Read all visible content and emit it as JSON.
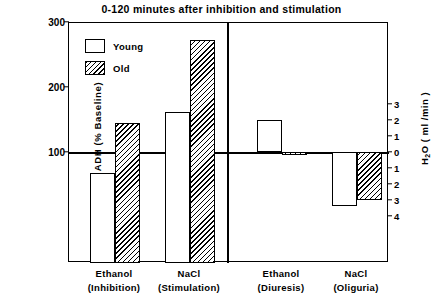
{
  "chart_data": {
    "type": "bar",
    "title": "0-120  minutes after inhibition and stimulation",
    "ylabel": "ADH (% Baseline)",
    "ylabel_right_pre": "H",
    "ylabel_right_sub": "2",
    "ylabel_right_post": "O  ( ml /min )",
    "ylabel_right_full": "H2O ( ml /min )",
    "xlabel": "",
    "grid": false,
    "legend_position": "top-left",
    "baseline_value": 100,
    "ylim": [
      0,
      300
    ],
    "ylim_right": [
      -4,
      3
    ],
    "left_axis_ticks": [
      {
        "label": "300",
        "value": 300
      },
      {
        "label": "200",
        "value": 200
      },
      {
        "label": "100",
        "value": 100
      }
    ],
    "right_axis_ticks": [
      {
        "label": "3",
        "value": 3
      },
      {
        "label": "2",
        "value": 2
      },
      {
        "label": "1",
        "value": 1
      },
      {
        "label": "0",
        "value": 0
      },
      {
        "label": "1",
        "value": -1
      },
      {
        "label": "2",
        "value": -2
      },
      {
        "label": "3",
        "value": -3
      },
      {
        "label": "4",
        "value": -4
      }
    ],
    "legend": [
      {
        "name": "Young",
        "fill": "open"
      },
      {
        "name": "Old",
        "fill": "hatched"
      }
    ],
    "panels": [
      {
        "id": "panel-adh",
        "axis": "left",
        "unit": "% Baseline",
        "categories": [
          {
            "line1": "Ethanol",
            "line2": "(Inhibition)"
          },
          {
            "line1": "NaCl",
            "line2": "(Stimulation)"
          }
        ],
        "series": [
          {
            "name": "Young",
            "values": [
              68,
              162
            ]
          },
          {
            "name": "Old",
            "values": [
              145,
              272
            ]
          }
        ]
      },
      {
        "id": "panel-h2o",
        "axis": "right",
        "unit": "ml/min",
        "categories": [
          {
            "line1": "Ethanol",
            "line2": "(Diuresis)"
          },
          {
            "line1": "NaCl",
            "line2": "(Oliguria)"
          }
        ],
        "series": [
          {
            "name": "Young",
            "values": [
              2.0,
              -3.4
            ]
          },
          {
            "name": "Old",
            "values": [
              -0.2,
              -3.0
            ]
          }
        ]
      }
    ],
    "colors": {
      "axis": "#000000",
      "young_fill": "#ffffff",
      "old_fill": "#ffffff",
      "hatch": "#000000",
      "background": "#ffffff"
    }
  }
}
